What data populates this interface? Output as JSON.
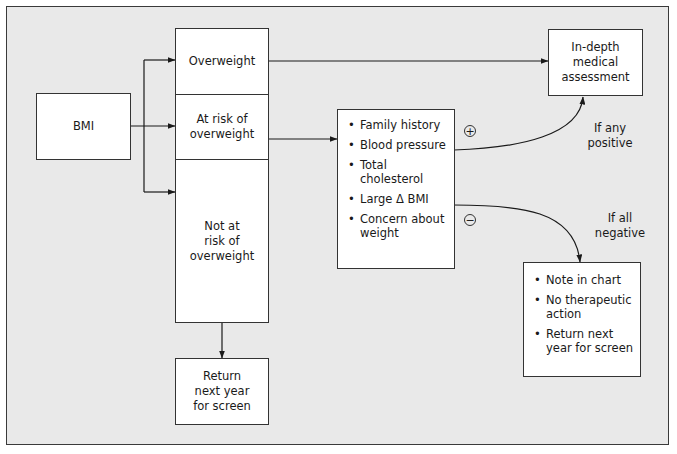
{
  "diagram": {
    "bmi": {
      "label": "BMI"
    },
    "categories": {
      "overweight": "Overweight",
      "at_risk": [
        "At risk of",
        "overweight"
      ],
      "not_at_risk": [
        "Not at",
        "risk of",
        "overweight"
      ]
    },
    "return_screen": [
      "Return",
      "next year",
      "for screen"
    ],
    "risk_factors": [
      "Family history",
      "Blood pressure",
      "Total cholesterol",
      "Large Δ BMI",
      "Concern about weight"
    ],
    "in_depth": [
      "In-depth",
      "medical",
      "assessment"
    ],
    "positive_sign": "+",
    "negative_sign": "−",
    "if_any_positive": [
      "If any",
      "positive"
    ],
    "if_all_negative": [
      "If all",
      "negative"
    ],
    "negative_actions": [
      "Note in chart",
      "No therapeutic action",
      "Return next year for screen"
    ]
  },
  "colors": {
    "background": "#e9e9e9",
    "box": "#ffffff",
    "line": "#1a1a1a"
  }
}
